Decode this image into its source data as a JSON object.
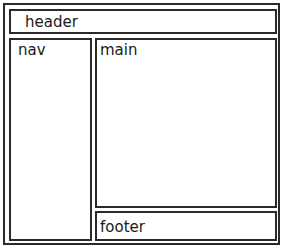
{
  "diagram": {
    "type": "page-layout-wireframe",
    "regions": {
      "header": {
        "label": "header"
      },
      "nav": {
        "label": "nav"
      },
      "main": {
        "label": "main"
      },
      "footer": {
        "label": "footer"
      }
    },
    "colors": {
      "border": "#2a2a2a",
      "background": "#ffffff",
      "text": "#1a1a1a"
    }
  }
}
